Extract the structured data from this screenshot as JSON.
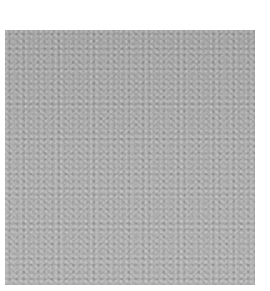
{
  "image": {
    "subject": "gray textured fabric/carpet swatch",
    "background_color": "#ffffff",
    "swatch_color": "#a9a9a9"
  }
}
